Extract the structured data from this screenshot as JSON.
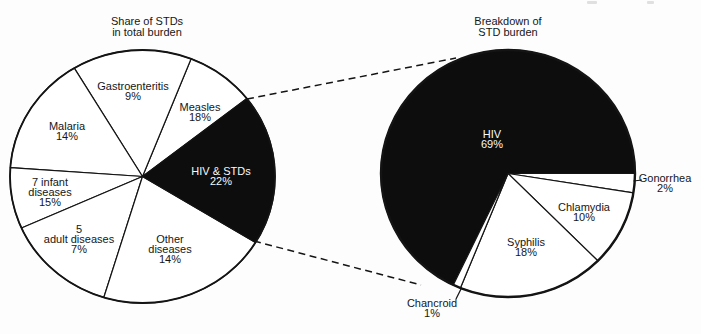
{
  "figure": {
    "background": "#fdfdfd",
    "ink": "#141414",
    "black_fill": "#0d0d0d",
    "white_fill": "#ffffff"
  },
  "chart_data": {
    "type": "pie",
    "legend": "none",
    "note": "Two-pie exploded figure: dashed lines project the black 'HIV & STDs' slice of the left pie onto the full right pie. Left pie printed values sum to 99%.",
    "charts": [
      {
        "id": "total-burden",
        "title": "Share of STDs\nin total burden",
        "cx": 142.5,
        "cy": 176.5,
        "rx": 132.5,
        "ry": 126.5,
        "outline_stroke": 1.8,
        "wedge_stroke": 1.2,
        "line_color": "#141414",
        "slices": [
          {
            "id": "measles",
            "label": "Measles",
            "pct": "18%",
            "value": 18,
            "start_deg": 38,
            "end_deg": 68.5,
            "fill": "#ffffff",
            "label_x": 200,
            "label_y": 112
          },
          {
            "id": "gastroenteritis",
            "label": "Gastroenteritis",
            "pct": "9%",
            "value": 9,
            "start_deg": 68.5,
            "end_deg": 121,
            "fill": "#ffffff",
            "label_x": 133,
            "label_y": 91
          },
          {
            "id": "malaria",
            "label": "Malaria",
            "pct": "14%",
            "value": 14,
            "start_deg": 121,
            "end_deg": 176,
            "fill": "#ffffff",
            "label_x": 67,
            "label_y": 131
          },
          {
            "id": "infant-diseases",
            "label": "7 infant\ndiseases",
            "pct": "15%",
            "value": 15,
            "start_deg": 176,
            "end_deg": 204,
            "fill": "#ffffff",
            "label_x": 50,
            "label_y": 192
          },
          {
            "id": "adult-diseases",
            "label": "5\nadult diseases",
            "pct": "7%",
            "value": 7,
            "start_deg": 204,
            "end_deg": 253,
            "fill": "#ffffff",
            "label_x": 79,
            "label_y": 239
          },
          {
            "id": "other-diseases",
            "label": "Other\ndiseases",
            "pct": "14%",
            "value": 14,
            "start_deg": 253,
            "end_deg": 328.5,
            "fill": "#ffffff",
            "label_x": 170,
            "label_y": 249
          },
          {
            "id": "hiv-stds",
            "label": "HIV & STDs",
            "pct": "22%",
            "value": 22,
            "start_deg": 328.5,
            "end_deg": 398,
            "fill": "#0d0d0d",
            "label_x": 221,
            "label_y": 176,
            "text": "light"
          }
        ]
      },
      {
        "id": "std-burden",
        "title": "Breakdown of\nSTD burden",
        "cx": 508,
        "cy": 173.5,
        "rx": 127,
        "ry": 123.5,
        "outline_stroke": 2.4,
        "wedge_stroke": 1.2,
        "line_color": "#141414",
        "slices": [
          {
            "id": "hiv",
            "label": "HIV",
            "pct": "69%",
            "value": 69,
            "start_deg": 0,
            "end_deg": 244.5,
            "fill": "#0d0d0d",
            "label_x": 492,
            "label_y": 139,
            "text": "light"
          },
          {
            "id": "gonorrhea",
            "label": "Gonorrhea",
            "pct": "2%",
            "value": 2,
            "start_deg": -9,
            "end_deg": 0,
            "fill": "#ffffff",
            "label_x": 665,
            "label_y": 183
          },
          {
            "id": "chlamydia",
            "label": "Chlamydia",
            "pct": "10%",
            "value": 10,
            "start_deg": -45,
            "end_deg": -9,
            "fill": "#ffffff",
            "label_x": 584,
            "label_y": 212
          },
          {
            "id": "syphilis",
            "label": "Syphilis",
            "pct": "18%",
            "value": 18,
            "start_deg": -112,
            "end_deg": -45,
            "fill": "#ffffff",
            "label_x": 526,
            "label_y": 247
          },
          {
            "id": "chancroid",
            "label": "Chancroid",
            "pct": "1%",
            "value": 1,
            "start_deg": -115.5,
            "end_deg": -112,
            "fill": "#ffffff",
            "label_x": 432,
            "label_y": 308
          }
        ]
      }
    ]
  },
  "titles": {
    "left": {
      "x": 147,
      "y": 26
    },
    "right": {
      "x": 508,
      "y": 26
    }
  }
}
